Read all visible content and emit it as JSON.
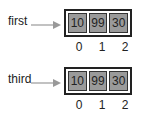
{
  "arrays": [
    {
      "name": "first",
      "values": [
        "10",
        "99",
        "30"
      ],
      "indices": [
        "0",
        "1",
        "2"
      ]
    },
    {
      "name": "third",
      "values": [
        "10",
        "99",
        "30"
      ],
      "indices": [
        "0",
        "1",
        "2"
      ]
    }
  ],
  "colors": {
    "cell_fill": "#9a9a9a",
    "border": "#222222",
    "arrow": "#999999"
  }
}
